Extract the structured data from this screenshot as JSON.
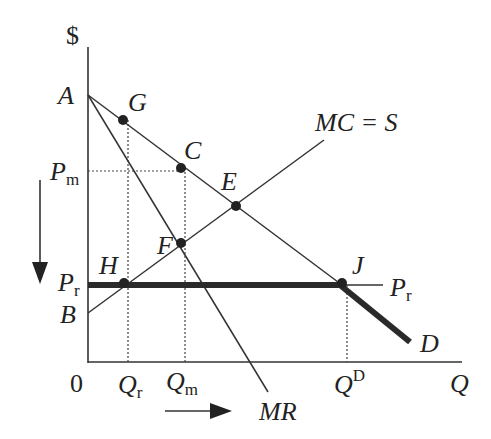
{
  "diagram": {
    "type": "economics price-ceiling monopoly diagram",
    "axes": {
      "y_label": "$",
      "x_label": "Q",
      "origin": "0"
    },
    "curves": {
      "demand": "D",
      "marginal_revenue": "MR",
      "supply": "MC = S",
      "price_ceiling": "P",
      "price_ceiling_sub": "r"
    },
    "points": {
      "A": "A",
      "G": "G",
      "C": "C",
      "E": "E",
      "F": "F",
      "H": "H",
      "J": "J",
      "B": "B"
    },
    "y_ticks": [
      {
        "main": "P",
        "sub": "m"
      },
      {
        "main": "P",
        "sub": "r"
      }
    ],
    "x_ticks": [
      {
        "main": "Q",
        "sub": "r"
      },
      {
        "main": "Q",
        "sub": "m"
      },
      {
        "main": "Q",
        "sup": "D"
      }
    ],
    "arrows": [
      "down arrow beside price axis",
      "right arrow below quantity axis"
    ],
    "colors": {
      "line": "#333333",
      "thick": "#2a2a2a"
    }
  }
}
